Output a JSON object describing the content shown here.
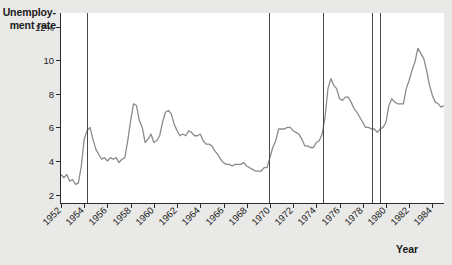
{
  "chart_data": {
    "type": "line",
    "title": "",
    "ylabel": "Unemploy-\nment rate",
    "ylabel_line1": "Unemploy-",
    "ylabel_line2": "ment rate",
    "xlabel": "Year",
    "ylim": [
      1.5,
      12.8
    ],
    "xlim": [
      1952.0,
      1985.0
    ],
    "grid": false,
    "legend": false,
    "ytick_labels": [
      "12%",
      "10",
      "8",
      "6",
      "4",
      "2"
    ],
    "ytick_values": [
      12,
      10,
      8,
      6,
      4,
      2
    ],
    "xtick_labels": [
      "1952",
      "1954",
      "1956",
      "1958",
      "1960",
      "1962",
      "1964",
      "1966",
      "1968",
      "1970",
      "1972",
      "1974",
      "1976",
      "1978",
      "1980",
      "1982",
      "1984"
    ],
    "xtick_values": [
      1952,
      1954,
      1956,
      1958,
      1960,
      1962,
      1964,
      1966,
      1968,
      1970,
      1972,
      1974,
      1976,
      1978,
      1980,
      1982,
      1984
    ],
    "series_name": "Unemployment rate",
    "line_color": "#8b8b8b",
    "axis_color": "#2b2b2b",
    "recession_marker_color": "#4a4a4a",
    "plot_background": "#ffffff",
    "figure_background": "#e9e9e7",
    "recession_markers": [
      1954.2,
      1969.9,
      1974.6,
      1978.8,
      1979.5
    ],
    "x": [
      1952.0,
      1952.25,
      1952.5,
      1952.75,
      1953.0,
      1953.25,
      1953.5,
      1953.75,
      1954.0,
      1954.25,
      1954.5,
      1954.75,
      1955.0,
      1955.25,
      1955.5,
      1955.75,
      1956.0,
      1956.25,
      1956.5,
      1956.75,
      1957.0,
      1957.25,
      1957.5,
      1957.75,
      1958.0,
      1958.25,
      1958.5,
      1958.75,
      1959.0,
      1959.25,
      1959.5,
      1959.75,
      1960.0,
      1960.25,
      1960.5,
      1960.75,
      1961.0,
      1961.25,
      1961.5,
      1961.75,
      1962.0,
      1962.25,
      1962.5,
      1962.75,
      1963.0,
      1963.25,
      1963.5,
      1963.75,
      1964.0,
      1964.25,
      1964.5,
      1964.75,
      1965.0,
      1965.25,
      1965.5,
      1965.75,
      1966.0,
      1966.25,
      1966.5,
      1966.75,
      1967.0,
      1967.25,
      1967.5,
      1967.75,
      1968.0,
      1968.25,
      1968.5,
      1968.75,
      1969.0,
      1969.25,
      1969.5,
      1969.75,
      1970.0,
      1970.25,
      1970.5,
      1970.75,
      1971.0,
      1971.25,
      1971.5,
      1971.75,
      1972.0,
      1972.25,
      1972.5,
      1972.75,
      1973.0,
      1973.25,
      1973.5,
      1973.75,
      1974.0,
      1974.25,
      1974.5,
      1974.75,
      1975.0,
      1975.25,
      1975.5,
      1975.75,
      1976.0,
      1976.25,
      1976.5,
      1976.75,
      1977.0,
      1977.25,
      1977.5,
      1977.75,
      1978.0,
      1978.25,
      1978.5,
      1978.75,
      1979.0,
      1979.25,
      1979.5,
      1979.75,
      1980.0,
      1980.25,
      1980.5,
      1980.75,
      1981.0,
      1981.25,
      1981.5,
      1981.75,
      1982.0,
      1982.25,
      1982.5,
      1982.75,
      1983.0,
      1983.25,
      1983.5,
      1983.75,
      1984.0,
      1984.25,
      1984.5,
      1984.75,
      1985.0
    ],
    "values": [
      3.2,
      3.0,
      3.2,
      2.8,
      2.9,
      2.6,
      2.7,
      3.7,
      5.3,
      5.8,
      6.0,
      5.3,
      4.7,
      4.4,
      4.1,
      4.2,
      4.0,
      4.2,
      4.1,
      4.2,
      3.9,
      4.1,
      4.2,
      5.2,
      6.4,
      7.4,
      7.3,
      6.4,
      6.0,
      5.1,
      5.3,
      5.6,
      5.1,
      5.2,
      5.5,
      6.3,
      6.9,
      7.0,
      6.8,
      6.2,
      5.8,
      5.5,
      5.6,
      5.5,
      5.8,
      5.7,
      5.5,
      5.5,
      5.6,
      5.2,
      5.0,
      5.0,
      4.9,
      4.6,
      4.4,
      4.1,
      3.9,
      3.8,
      3.8,
      3.7,
      3.8,
      3.8,
      3.8,
      3.9,
      3.7,
      3.6,
      3.5,
      3.4,
      3.4,
      3.4,
      3.6,
      3.6,
      4.2,
      4.8,
      5.2,
      5.9,
      5.9,
      5.9,
      6.0,
      6.0,
      5.8,
      5.7,
      5.6,
      5.3,
      4.9,
      4.9,
      4.8,
      4.8,
      5.1,
      5.2,
      5.6,
      6.6,
      8.3,
      8.9,
      8.5,
      8.3,
      7.7,
      7.6,
      7.8,
      7.8,
      7.5,
      7.1,
      6.9,
      6.6,
      6.3,
      6.0,
      6.0,
      5.9,
      5.9,
      5.7,
      5.9,
      6.0,
      6.3,
      7.3,
      7.7,
      7.5,
      7.4,
      7.4,
      7.4,
      8.3,
      8.8,
      9.4,
      9.9,
      10.7,
      10.4,
      10.1,
      9.4,
      8.5,
      7.9,
      7.5,
      7.4,
      7.2,
      7.3
    ]
  }
}
